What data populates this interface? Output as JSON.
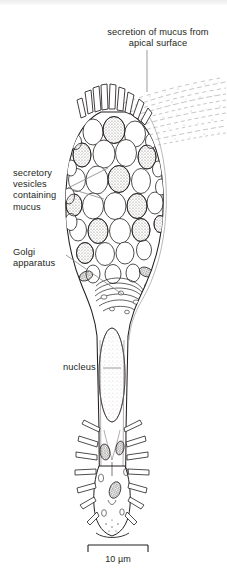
{
  "figure": {
    "type": "biological-diagram",
    "scale_bar": {
      "length_label": "10 µm",
      "value": 10,
      "unit": "µm"
    },
    "ink_color": "#231f20",
    "leader_color": "#8a8a8a",
    "background": "#ffffff"
  },
  "labels": {
    "apical_secretion": "secretion of mucus from\napical surface",
    "secretory_vesicles": "secretory\nvesicles\ncontaining\nmucus",
    "golgi": "Golgi\napparatus",
    "nucleus": "nucleus",
    "scale": "10 µm"
  },
  "structures": [
    {
      "name": "microvilli",
      "region": "apical"
    },
    {
      "name": "mucus-plume",
      "region": "apical-right"
    },
    {
      "name": "secretory-vesicles",
      "region": "theca"
    },
    {
      "name": "golgi-apparatus",
      "region": "supranuclear"
    },
    {
      "name": "nucleus",
      "region": "basal-stalk"
    },
    {
      "name": "mitochondria",
      "region": "basal"
    },
    {
      "name": "basal-processes",
      "region": "base"
    }
  ]
}
